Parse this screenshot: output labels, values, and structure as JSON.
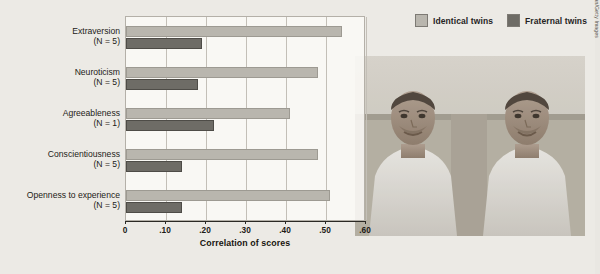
{
  "chart_data": {
    "type": "bar",
    "orientation": "horizontal",
    "title": "",
    "xlabel": "Correlation of scores",
    "ylabel": "",
    "xlim": [
      0,
      0.6
    ],
    "grid": true,
    "legend_position": "top-right",
    "categories": [
      "Extraversion",
      "Neuroticism",
      "Agreeableness",
      "Conscientiousness",
      "Openness to experience"
    ],
    "category_notes": [
      "(N = 5)",
      "(N = 5)",
      "(N = 1)",
      "(N = 5)",
      "(N = 5)"
    ],
    "tick_labels": [
      "0",
      ".10",
      ".20",
      ".30",
      ".40",
      ".50",
      ".60"
    ],
    "tick_values": [
      0,
      0.1,
      0.2,
      0.3,
      0.4,
      0.5,
      0.6
    ],
    "series": [
      {
        "name": "Identical twins",
        "color": "#b9b6ae",
        "values": [
          0.54,
          0.48,
          0.41,
          0.48,
          0.51
        ]
      },
      {
        "name": "Fraternal twins",
        "color": "#6e6c66",
        "values": [
          0.19,
          0.18,
          0.22,
          0.14,
          0.14
        ]
      }
    ]
  },
  "legend": {
    "entries": [
      {
        "label": "Identical twins",
        "swatch": "#b9b6ae"
      },
      {
        "label": "Fraternal twins",
        "swatch": "#6e6c66"
      }
    ]
  },
  "photo": {
    "alt": "Two identical twin men in white t-shirts seated side by side",
    "credit": "© Ray Kachatorian/Getty Images"
  },
  "colors": {
    "background": "#eceae5",
    "plot_background": "#faf9f6",
    "grid": "#c3bfb7",
    "axis": "#2b2924",
    "text": "#1d1b17"
  }
}
